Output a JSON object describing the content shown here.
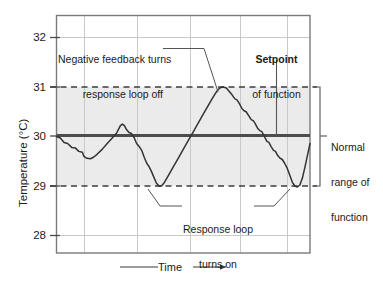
{
  "chart_data": {
    "type": "line",
    "title": "",
    "xlabel": "Time",
    "ylabel": "Temperature (°C)",
    "ylim": [
      27.6,
      32.3
    ],
    "yticks": [
      32,
      31,
      30,
      29,
      28
    ],
    "ytick_labels": [
      "32",
      "31",
      "30",
      "29",
      "28"
    ],
    "xlim": [
      0,
      100
    ],
    "xticks": [
      11,
      32,
      53,
      73,
      92
    ],
    "xtick_labels": [
      "",
      "",
      "",
      "",
      ""
    ],
    "grid": true,
    "legend": null,
    "setpoint_value": 30,
    "normal_range": [
      29,
      31
    ],
    "shaded_band": {
      "from": 29,
      "to": 31,
      "color": "#ebebeb"
    },
    "reference_lines": [
      {
        "value": 31,
        "style": "dashed",
        "label": "upper limit of normal range"
      },
      {
        "value": 30,
        "style": "solid-thick",
        "label": "Setpoint"
      },
      {
        "value": 29,
        "style": "dashed",
        "label": "lower limit of normal range"
      }
    ],
    "series": [
      {
        "name": "Temperature",
        "color": "#333333",
        "points": [
          [
            0.0,
            30.0
          ],
          [
            1.5,
            29.97
          ],
          [
            3.0,
            29.88
          ],
          [
            4.4,
            29.86
          ],
          [
            6.0,
            29.78
          ],
          [
            7.4,
            29.77
          ],
          [
            8.8,
            29.7
          ],
          [
            10.2,
            29.68
          ],
          [
            10.8,
            29.6
          ],
          [
            12.0,
            29.56
          ],
          [
            13.4,
            29.55
          ],
          [
            14.6,
            29.58
          ],
          [
            16.0,
            29.64
          ],
          [
            18.0,
            29.74
          ],
          [
            20.0,
            29.86
          ],
          [
            22.0,
            29.97
          ],
          [
            23.6,
            30.06
          ],
          [
            24.4,
            30.14
          ],
          [
            25.2,
            30.22
          ],
          [
            26.0,
            30.25
          ],
          [
            26.8,
            30.22
          ],
          [
            27.6,
            30.14
          ],
          [
            28.6,
            30.08
          ],
          [
            29.6,
            30.06
          ],
          [
            30.6,
            29.98
          ],
          [
            31.6,
            29.86
          ],
          [
            32.6,
            29.8
          ],
          [
            33.6,
            29.72
          ],
          [
            34.6,
            29.58
          ],
          [
            35.6,
            29.46
          ],
          [
            36.4,
            29.4
          ],
          [
            37.4,
            29.3
          ],
          [
            38.4,
            29.18
          ],
          [
            39.4,
            29.06
          ],
          [
            40.4,
            29.0
          ],
          [
            41.4,
            29.0
          ],
          [
            42.4,
            29.06
          ],
          [
            44.0,
            29.2
          ],
          [
            46.0,
            29.38
          ],
          [
            48.0,
            29.56
          ],
          [
            50.0,
            29.74
          ],
          [
            52.0,
            29.92
          ],
          [
            54.0,
            30.1
          ],
          [
            56.0,
            30.28
          ],
          [
            58.0,
            30.46
          ],
          [
            60.0,
            30.64
          ],
          [
            61.6,
            30.78
          ],
          [
            62.8,
            30.88
          ],
          [
            63.8,
            30.95
          ],
          [
            64.8,
            30.99
          ],
          [
            65.8,
            31.0
          ],
          [
            67.0,
            30.98
          ],
          [
            68.0,
            30.92
          ],
          [
            69.0,
            30.86
          ],
          [
            69.8,
            30.8
          ],
          [
            70.4,
            30.76
          ],
          [
            71.2,
            30.74
          ],
          [
            72.2,
            30.66
          ],
          [
            73.2,
            30.56
          ],
          [
            74.0,
            30.52
          ],
          [
            74.8,
            30.5
          ],
          [
            75.8,
            30.42
          ],
          [
            76.8,
            30.34
          ],
          [
            77.6,
            30.32
          ],
          [
            78.4,
            30.26
          ],
          [
            79.4,
            30.16
          ],
          [
            80.2,
            30.12
          ],
          [
            81.0,
            30.1
          ],
          [
            82.0,
            30.0
          ],
          [
            83.0,
            29.9
          ],
          [
            83.8,
            29.88
          ],
          [
            84.6,
            29.8
          ],
          [
            85.6,
            29.72
          ],
          [
            86.4,
            29.7
          ],
          [
            87.2,
            29.62
          ],
          [
            88.2,
            29.56
          ],
          [
            89.0,
            29.54
          ],
          [
            90.0,
            29.46
          ],
          [
            91.0,
            29.36
          ],
          [
            92.0,
            29.22
          ],
          [
            93.0,
            29.08
          ],
          [
            94.0,
            29.0
          ],
          [
            95.0,
            28.98
          ],
          [
            96.0,
            29.02
          ],
          [
            97.0,
            29.16
          ],
          [
            98.0,
            29.38
          ],
          [
            99.0,
            29.62
          ],
          [
            100.0,
            29.86
          ]
        ]
      }
    ],
    "annotations": [
      {
        "id": "negative-feedback",
        "lines": [
          "Negative feedback turns",
          "response loop off"
        ],
        "bold": false,
        "points_to": "curve descent after upper peak"
      },
      {
        "id": "setpoint",
        "lines": [
          "Setpoint",
          "of function"
        ],
        "bold_first_line": true,
        "points_to": "30 °C setpoint line"
      },
      {
        "id": "response-loop",
        "lines": [
          "Response loop",
          "turns on"
        ],
        "bold": false,
        "points_to": "curve troughs at 29 °C"
      },
      {
        "id": "normal-range",
        "lines": [
          "Normal",
          "range of",
          "function"
        ],
        "bold": false,
        "points_to": "bracket spanning 29–31 °C"
      }
    ]
  },
  "axis": {
    "ylabel": "Temperature (°C)",
    "ytick_32": "32",
    "ytick_31": "31",
    "ytick_30": "30",
    "ytick_29": "29",
    "ytick_28": "28",
    "xlabel": "Time"
  },
  "annotations": {
    "negative_feedback_line1": "Negative feedback turns",
    "negative_feedback_line2": "response loop off",
    "setpoint_title": "Setpoint",
    "setpoint_sub": "of function",
    "response_loop_line1": "Response loop",
    "response_loop_line2": "turns on",
    "normal_range_line1": "Normal",
    "normal_range_line2": "range of",
    "normal_range_line3": "function"
  },
  "colors": {
    "band": "#ebebeb",
    "curve": "#333333",
    "setpoint_line": "#4d4d4d",
    "grid": "#c9c9c9",
    "frame": "#7a7a7a",
    "text": "#1a1a1a"
  }
}
